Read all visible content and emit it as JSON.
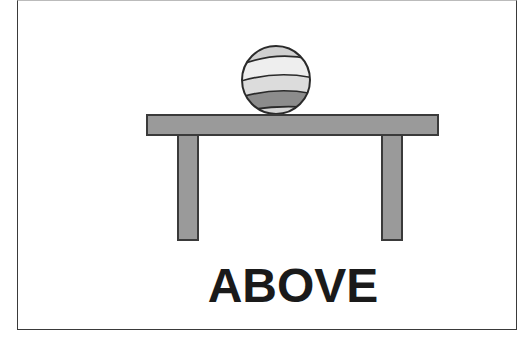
{
  "card": {
    "label": "ABOVE",
    "illustration": {
      "object": "striped-ball",
      "support": "table",
      "relation": "above"
    }
  },
  "colors": {
    "table_fill": "#9a9a9a",
    "table_stroke": "#3a3a3a",
    "ball_dark_band": "#8c8c8c",
    "ball_light": "#d4d4d4",
    "ball_lighter": "#e8e8e8",
    "text": "#1a1a1a",
    "frame": "#3a3a3a"
  }
}
